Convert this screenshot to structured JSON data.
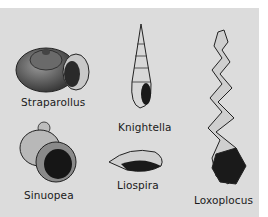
{
  "figure": {
    "background_color": "#dcdcdc",
    "specimens": [
      {
        "name": "Straparollus",
        "shape": "low-spired coiled shell"
      },
      {
        "name": "Knightella",
        "shape": "high-spired slender shell"
      },
      {
        "name": "Loxoplocus",
        "shape": "loosely coiled tall spiral shell"
      },
      {
        "name": "Sinuopea",
        "shape": "globular shell with large aperture"
      },
      {
        "name": "Liospira",
        "shape": "lenticular low shell"
      }
    ]
  }
}
